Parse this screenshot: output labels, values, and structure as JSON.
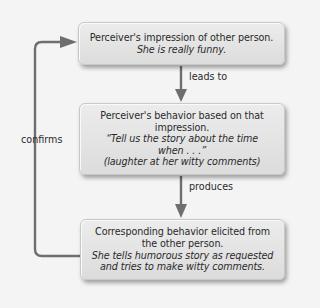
{
  "diagram": {
    "type": "flowchart",
    "boxes": [
      {
        "id": "box1",
        "title": "Perceiver's impression of other person.",
        "example_lines": [
          "She is really funny."
        ]
      },
      {
        "id": "box2",
        "title_lines": [
          "Perceiver's behavior based on that",
          "impression."
        ],
        "example_lines": [
          "“Tell us the story about the time",
          "when . . .”",
          "(laughter at her witty comments)"
        ]
      },
      {
        "id": "box3",
        "title_lines": [
          "Corresponding behavior elicited from",
          "the other person."
        ],
        "example_lines": [
          "She tells humorous story as requested",
          "and tries to make witty comments."
        ]
      }
    ],
    "edges": [
      {
        "from": "box1",
        "to": "box2",
        "label": "leads to"
      },
      {
        "from": "box2",
        "to": "box3",
        "label": "produces"
      },
      {
        "from": "box3",
        "to": "box1",
        "label": "confirms"
      }
    ],
    "colors": {
      "background": "#f4f4f4",
      "box_fill": "#e4e4e4",
      "arrow": "#6e6e6e",
      "text": "#2a2a2a"
    }
  }
}
